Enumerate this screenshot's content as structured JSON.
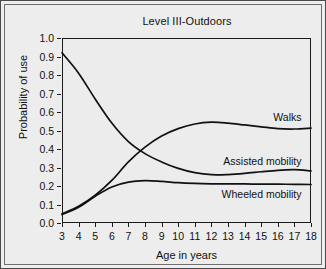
{
  "chart_data": {
    "type": "line",
    "title": "Level III-Outdoors",
    "xlabel": "Age in years",
    "ylabel": "Probability of use",
    "xlim": [
      3,
      18
    ],
    "ylim": [
      0.0,
      1.0
    ],
    "grid": false,
    "legend_position": "inline-right",
    "xticks": [
      "3",
      "4",
      "5",
      "6",
      "7",
      "8",
      "9",
      "10",
      "11",
      "12",
      "13",
      "14",
      "15",
      "16",
      "17",
      "18"
    ],
    "yticks": [
      "0.0",
      "0.1",
      "0.2",
      "0.3",
      "0.4",
      "0.5",
      "0.6",
      "0.7",
      "0.8",
      "0.9",
      "1.0"
    ],
    "x": [
      3,
      4,
      5,
      6,
      7,
      8,
      9,
      10,
      11,
      12,
      13,
      14,
      15,
      16,
      17,
      18
    ],
    "series": [
      {
        "name": "Walks",
        "label": "Walks",
        "color": "#111111",
        "values": [
          0.05,
          0.09,
          0.15,
          0.23,
          0.33,
          0.41,
          0.47,
          0.51,
          0.535,
          0.545,
          0.54,
          0.53,
          0.52,
          0.51,
          0.508,
          0.513
        ]
      },
      {
        "name": "Assisted mobility",
        "label": "Assisted mobility",
        "color": "#111111",
        "values": [
          0.92,
          0.81,
          0.67,
          0.54,
          0.44,
          0.375,
          0.33,
          0.295,
          0.272,
          0.261,
          0.262,
          0.268,
          0.277,
          0.285,
          0.288,
          0.282
        ]
      },
      {
        "name": "Wheeled mobility",
        "label": "Wheeled mobility",
        "color": "#111111",
        "values": [
          0.045,
          0.085,
          0.145,
          0.195,
          0.221,
          0.229,
          0.225,
          0.218,
          0.214,
          0.212,
          0.211,
          0.211,
          0.21,
          0.21,
          0.209,
          0.208
        ]
      }
    ],
    "series_labels": [
      {
        "text": "Walks",
        "x": 17.85,
        "y": 0.575
      },
      {
        "text": "Assisted mobility",
        "x": 17.85,
        "y": 0.335
      },
      {
        "text": "Wheeled mobility",
        "x": 17.85,
        "y": 0.158
      }
    ]
  }
}
